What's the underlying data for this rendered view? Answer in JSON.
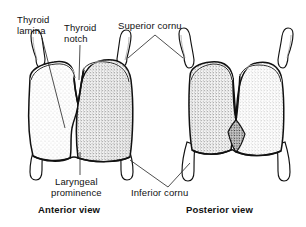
{
  "figure": {
    "background_color": "#ffffff",
    "ink_color": "#000000",
    "labels": {
      "thyroid_lamina": "Thyroid\nlamina",
      "thyroid_notch": "Thyroid\nnotch",
      "superior_cornu": "Superior cornu",
      "laryngeal_prominence": "Laryngeal\nprominence",
      "inferior_cornu": "Inferior cornu"
    },
    "captions": {
      "anterior": "Anterior view",
      "posterior": "Posterior view"
    },
    "views": [
      {
        "name": "anterior",
        "caption": "Anterior view",
        "structures": [
          "thyroid lamina",
          "thyroid notch",
          "laryngeal prominence",
          "superior cornu",
          "inferior cornu"
        ]
      },
      {
        "name": "posterior",
        "caption": "Posterior view",
        "structures": [
          "thyroid lamina",
          "superior cornu",
          "inferior cornu"
        ]
      }
    ]
  }
}
